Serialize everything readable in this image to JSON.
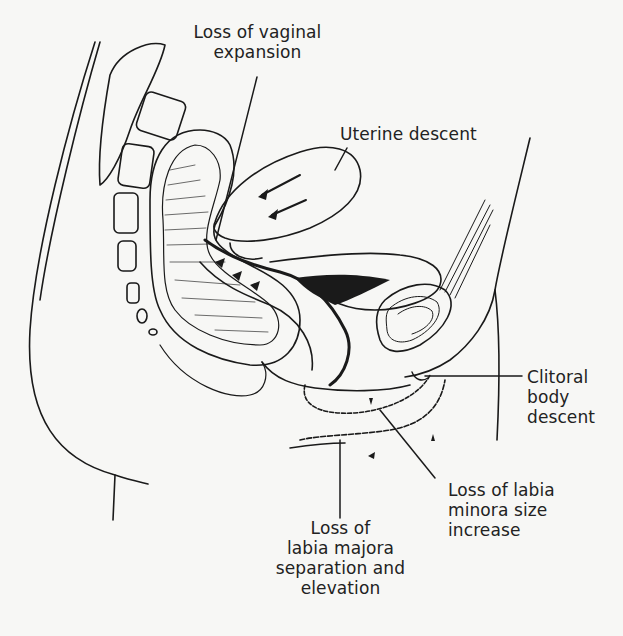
{
  "figure": {
    "type": "sagittal anatomical line drawing (female pelvis)",
    "ink_color": "#1a1a1a",
    "paper_color": "#f7f7f5"
  },
  "labels": {
    "vaginal_expansion": "Loss of vaginal\nexpansion",
    "uterine_descent": "Uterine descent",
    "clitoral_body": "Clitoral\nbody\ndescent",
    "labia_minora": "Loss of labia\nminora size\nincrease",
    "labia_majora": "Loss of\nlabia majora\nseparation and\nelevation"
  }
}
